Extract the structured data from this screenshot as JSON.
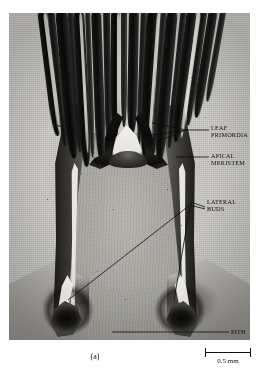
{
  "figure": {
    "caption": "(a)",
    "plate_type": "light micrograph"
  },
  "annotations": [
    {
      "id": "leaf-primordia",
      "label": "LEAF\nPRIMORDIA",
      "leaders": 3
    },
    {
      "id": "apical-meristem",
      "label": "APICAL\nMERISTEM",
      "leaders": 1
    },
    {
      "id": "lateral-buds",
      "label": "LATERAL\nBUDS",
      "leaders": 2
    },
    {
      "id": "pith",
      "label": "PITH",
      "leaders": 1
    }
  ],
  "scale_bar": {
    "value": "0.5 mm"
  },
  "colors": {
    "background": "#ffffff",
    "plate_base": "#c9c7c2",
    "tissue_dark": "#141210",
    "ink": "#100f0e"
  }
}
